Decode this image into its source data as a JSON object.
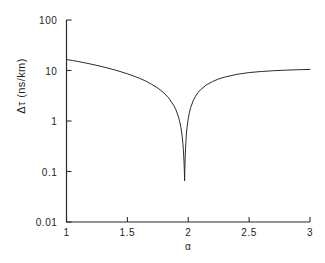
{
  "chart_data": {
    "type": "line",
    "title": "",
    "xlabel": "α",
    "ylabel": "Δτ (ns/km)",
    "yscale": "log",
    "xscale": "linear",
    "xlim": [
      1,
      3
    ],
    "ylim": [
      0.01,
      100
    ],
    "grid": false,
    "legend": null,
    "xticks": [
      1,
      1.5,
      2,
      2.5,
      3
    ],
    "xtick_labels": [
      "1",
      "1.5",
      "2",
      "2.5",
      "3"
    ],
    "yticks": [
      0.01,
      0.1,
      1,
      10,
      100
    ],
    "ytick_labels": [
      "0.01",
      "0.1",
      "1",
      "10",
      "100"
    ],
    "series": [
      {
        "name": "Δτ",
        "color": "#2b2b2b",
        "linewidth": 1,
        "x": [
          1.0,
          1.05,
          1.1,
          1.15,
          1.2,
          1.25,
          1.3,
          1.35,
          1.4,
          1.45,
          1.5,
          1.55,
          1.6,
          1.65,
          1.7,
          1.75,
          1.8,
          1.84,
          1.88,
          1.9,
          1.92,
          1.93,
          1.94,
          1.95,
          1.955,
          1.96,
          1.965,
          1.968,
          1.97,
          1.972,
          1.975,
          1.98,
          1.985,
          1.99,
          2.0,
          2.01,
          2.02,
          2.04,
          2.06,
          2.08,
          2.1,
          2.15,
          2.2,
          2.25,
          2.3,
          2.4,
          2.5,
          2.6,
          2.7,
          2.8,
          2.9,
          3.0
        ],
        "y": [
          16.5,
          15.8,
          15.0,
          14.2,
          13.4,
          12.6,
          11.8,
          11.0,
          10.2,
          9.4,
          8.6,
          7.8,
          7.0,
          6.2,
          5.3,
          4.5,
          3.6,
          2.85,
          2.05,
          1.65,
          1.2,
          0.97,
          0.74,
          0.5,
          0.38,
          0.27,
          0.16,
          0.105,
          0.065,
          0.11,
          0.2,
          0.36,
          0.55,
          0.74,
          1.12,
          1.5,
          1.85,
          2.5,
          3.1,
          3.65,
          4.15,
          5.2,
          6.05,
          6.8,
          7.4,
          8.4,
          9.1,
          9.55,
          9.9,
          10.15,
          10.35,
          10.5
        ]
      }
    ],
    "annotations": {
      "minimum_alpha": "1.97",
      "minimum_value": "0.065"
    }
  },
  "axes": {
    "y_title": "Δτ (ns/km)",
    "x_title": "α"
  }
}
